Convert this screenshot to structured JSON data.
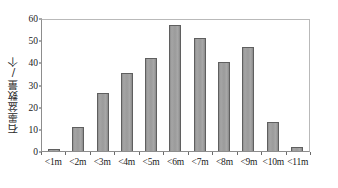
{
  "chart_data": {
    "type": "bar",
    "title": "",
    "xlabel": "",
    "ylabel": "石墨盆数量/个",
    "categories": [
      "<1m",
      "<2m",
      "<3m",
      "<4m",
      "<5m",
      "<6m",
      "<7m",
      "<8m",
      "<9m",
      "<10m",
      "<11m"
    ],
    "values": [
      1,
      11,
      26,
      35,
      42,
      57,
      51,
      40,
      47,
      13,
      2
    ],
    "ylim": [
      0,
      60
    ],
    "ytick_labels": [
      "0",
      "10",
      "20",
      "30",
      "40",
      "50",
      "60"
    ],
    "ytick_values": [
      0,
      10,
      20,
      30,
      40,
      50,
      60
    ],
    "grid": false,
    "legend": false,
    "legend_position": "none",
    "bar_color": "#9b9b9b",
    "bar_edge_color": "#5f5f5f",
    "frame_color": "#8d8d8d",
    "background": "#ffffff",
    "text_color": "#1a1a1a"
  }
}
